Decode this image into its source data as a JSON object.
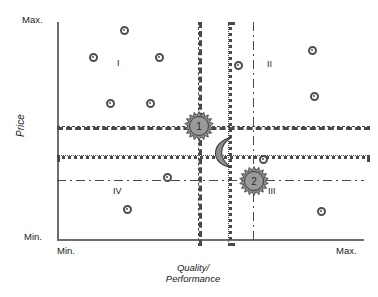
{
  "chart_data": {
    "type": "scatter",
    "title": "",
    "xlabel": "Quality/\nPerformance",
    "ylabel": "Price",
    "xlim_labels": [
      "Min.",
      "Max."
    ],
    "ylim_labels": [
      "Min.",
      "Max."
    ],
    "grid": true,
    "legend_position": "none",
    "axis_end_labels": {
      "y_max": "Max.",
      "y_min": "Min.",
      "x_min": "Min.",
      "x_max": "Max."
    },
    "axis_titles": {
      "y": "Price",
      "x_line1": "Quality/",
      "x_line2": "Performance"
    },
    "quadrant_labels": [
      {
        "name": "I",
        "x": 117,
        "y": 58
      },
      {
        "name": "II",
        "x": 267,
        "y": 59
      },
      {
        "name": "III",
        "x": 268,
        "y": 186
      },
      {
        "name": "IV",
        "x": 113,
        "y": 186
      }
    ],
    "reference_lines": [
      {
        "name": "price-upper-dashed",
        "orientation": "horizontal",
        "style": "dashed",
        "pos": 126
      },
      {
        "name": "price-mid-dotted",
        "orientation": "horizontal",
        "style": "dotted",
        "pos": 155
      },
      {
        "name": "price-lower-dashdot",
        "orientation": "horizontal",
        "style": "dashdot",
        "pos": 180
      },
      {
        "name": "quality-left-dashed",
        "orientation": "vertical",
        "style": "dashed",
        "pos": 198
      },
      {
        "name": "quality-mid-dotted",
        "orientation": "vertical",
        "style": "dotted",
        "pos": 228
      },
      {
        "name": "quality-right-dashdot",
        "orientation": "vertical",
        "style": "dashdot",
        "pos": 253
      }
    ],
    "series": [
      {
        "name": "competitors",
        "marker": "circle-ring",
        "points": [
          {
            "x": 124,
            "y": 30
          },
          {
            "x": 93,
            "y": 57
          },
          {
            "x": 159,
            "y": 57
          },
          {
            "x": 110,
            "y": 103
          },
          {
            "x": 150,
            "y": 103
          },
          {
            "x": 238,
            "y": 65
          },
          {
            "x": 312,
            "y": 50
          },
          {
            "x": 314,
            "y": 96
          },
          {
            "x": 167,
            "y": 177
          },
          {
            "x": 127,
            "y": 209
          },
          {
            "x": 263,
            "y": 159
          },
          {
            "x": 321,
            "y": 211
          }
        ]
      },
      {
        "name": "own-products",
        "marker": "sun",
        "points": [
          {
            "label": "1",
            "x": 199,
            "y": 126
          },
          {
            "label": "2",
            "x": 254,
            "y": 181
          }
        ]
      },
      {
        "name": "target-position",
        "marker": "crescent-moon",
        "points": [
          {
            "label": "",
            "x": 224,
            "y": 152
          }
        ]
      }
    ],
    "colors": {
      "axis": "#6e6e6e",
      "gridline": "#4a4a4a",
      "marker_ring": "#4e4e4e",
      "symbol_fill": "#8c8c8c",
      "symbol_stroke": "#3d3d3d",
      "text": "#1a1a1a",
      "background": "#ffffff"
    }
  }
}
